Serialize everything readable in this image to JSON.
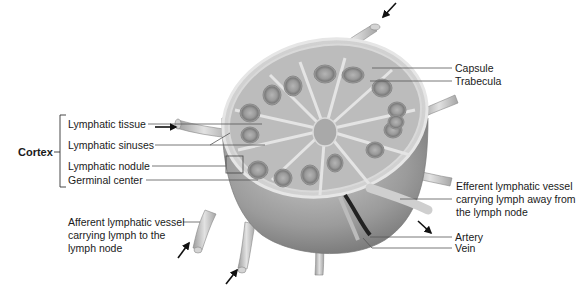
{
  "diagram": {
    "group_label": "Cortex",
    "labels": {
      "lymphatic_tissue": "Lymphatic tissue",
      "lymphatic_sinuses": "Lymphatic sinuses",
      "lymphatic_nodule": "Lymphatic nodule",
      "germinal_center": "Germinal center",
      "capsule": "Capsule",
      "trabecula": "Trabecula",
      "efferent": [
        "Efferent lymphatic vessel",
        "carrying lymph away from",
        "the lymph node"
      ],
      "artery": "Artery",
      "vein": "Vein",
      "afferent": [
        "Afferent lymphatic vessel",
        "carrying lymph to the",
        "lymph node"
      ]
    },
    "arrows": [
      {
        "name": "afferent-arrow-top",
        "direction": "down-left"
      },
      {
        "name": "afferent-arrow-left",
        "direction": "right"
      },
      {
        "name": "afferent-arrow-bottom-left",
        "direction": "up-right"
      },
      {
        "name": "afferent-arrow-bottom",
        "direction": "up-right"
      },
      {
        "name": "efferent-arrow",
        "direction": "down-right"
      }
    ],
    "colors": {
      "background": "#ffffff",
      "text": "#1a1a1a",
      "leader_line": "#555555",
      "node_body": "#9a9a9a",
      "cut_surface": "#d8d8d8",
      "nodule": "#8c8c8c",
      "vessel": "#c8c8c8"
    }
  }
}
